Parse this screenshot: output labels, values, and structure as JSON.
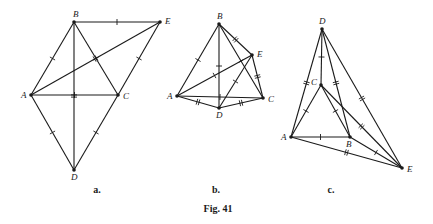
{
  "figure": {
    "caption": "Fig. 41",
    "subfigures": [
      {
        "label": "a.",
        "points": {
          "A": [
            31,
            95
          ],
          "B": [
            74,
            22
          ],
          "C": [
            118,
            95
          ],
          "D": [
            74,
            170
          ],
          "E": [
            160,
            22
          ]
        },
        "segments": [
          [
            "A",
            "B",
            1
          ],
          [
            "B",
            "C",
            1
          ],
          [
            "A",
            "C",
            1
          ],
          [
            "A",
            "D",
            1
          ],
          [
            "C",
            "D",
            1
          ],
          [
            "B",
            "E",
            1
          ],
          [
            "C",
            "E",
            1
          ],
          [
            "B",
            "D",
            2
          ],
          [
            "A",
            "E",
            2
          ]
        ]
      },
      {
        "label": "b.",
        "points": {
          "A": [
            177,
            96
          ],
          "B": [
            219,
            24
          ],
          "C": [
            263,
            98
          ],
          "D": [
            219,
            108
          ],
          "E": [
            252,
            55
          ]
        },
        "segments": [
          [
            "A",
            "B",
            1
          ],
          [
            "B",
            "C",
            1
          ],
          [
            "A",
            "C",
            1
          ],
          [
            "B",
            "D",
            1
          ],
          [
            "D",
            "E",
            1
          ],
          [
            "A",
            "E",
            1
          ],
          [
            "B",
            "E",
            2
          ],
          [
            "E",
            "C",
            2
          ],
          [
            "A",
            "D",
            2
          ],
          [
            "D",
            "C",
            2
          ]
        ]
      },
      {
        "label": "c.",
        "points": {
          "A": [
            291,
            137
          ],
          "B": [
            350,
            137
          ],
          "C": [
            321,
            85
          ],
          "D": [
            322,
            29
          ],
          "E": [
            402,
            168
          ]
        },
        "segments": [
          [
            "A",
            "B",
            1
          ],
          [
            "A",
            "C",
            1
          ],
          [
            "C",
            "B",
            1
          ],
          [
            "D",
            "C",
            1
          ],
          [
            "B",
            "E",
            1
          ],
          [
            "D",
            "A",
            2
          ],
          [
            "D",
            "B",
            2
          ],
          [
            "D",
            "E",
            2
          ],
          [
            "C",
            "E",
            2
          ],
          [
            "A",
            "E",
            2
          ]
        ]
      }
    ]
  }
}
